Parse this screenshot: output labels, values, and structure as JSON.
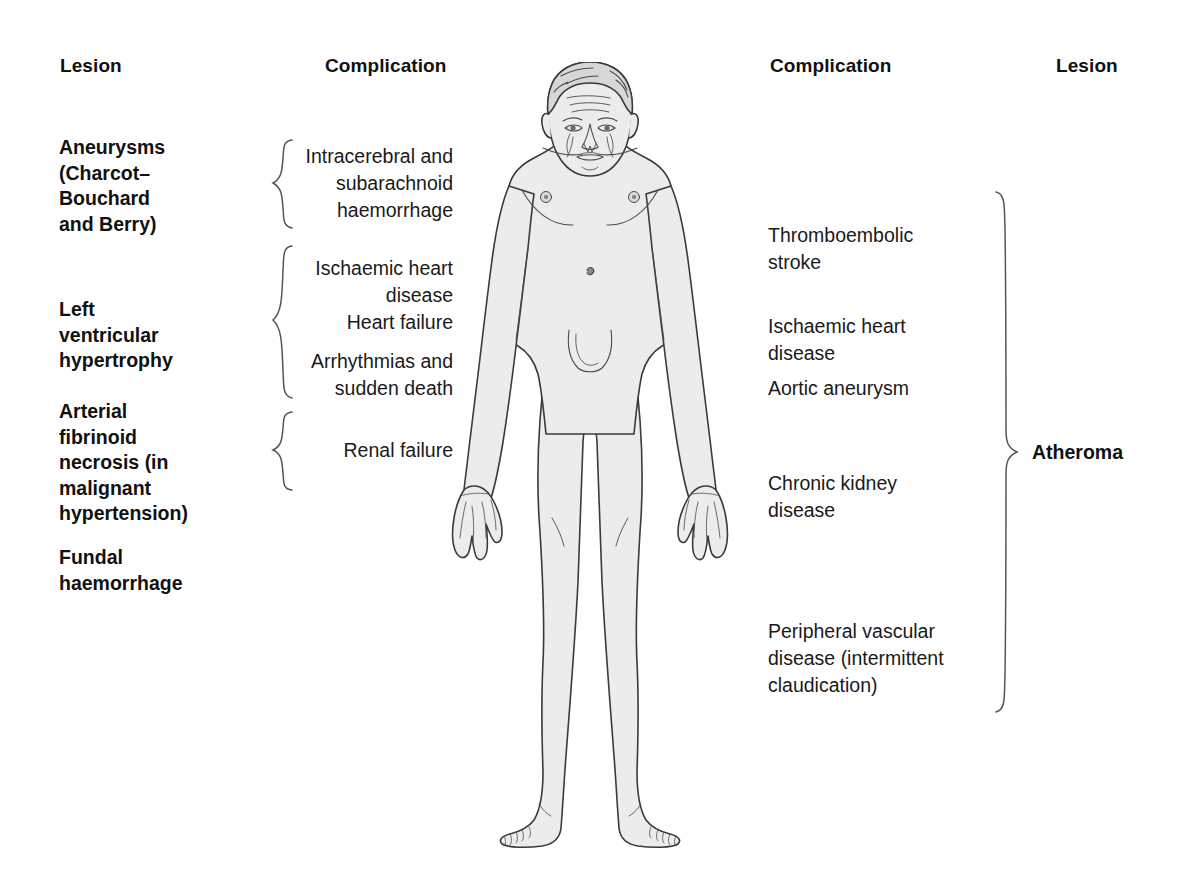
{
  "diagram": {
    "figure_name": "anterior-male-body-figure",
    "colors": {
      "text": "#111111",
      "body_fill": "#eceded",
      "body_outline": "#333333",
      "brace": "#555555",
      "background": "#ffffff"
    }
  },
  "headers": {
    "left_lesion": "Lesion",
    "left_complication": "Complication",
    "right_complication": "Complication",
    "right_lesion": "Lesion"
  },
  "left_lesions": [
    {
      "id": "aneurysms",
      "text": "Aneurysms\n(Charcot–\nBouchard\nand Berry)"
    },
    {
      "id": "left-ventricular-hypertrophy",
      "text": "Left\nventricular\nhypertrophy"
    },
    {
      "id": "arterial-fibrinoid-necrosis",
      "text": "Arterial\nfibrinoid\nnecrosis (in\nmalignant\nhypertension)"
    },
    {
      "id": "fundal-haemorrhage",
      "text": "Fundal\nhaemorrhage"
    }
  ],
  "left_complications": [
    {
      "id": "intracerebral-subarachnoid-haemorrhage",
      "text": "Intracerebral and\nsubarachnoid\nhaemorrhage"
    },
    {
      "id": "ischaemic-heart-disease-left",
      "text": "Ischaemic heart\ndisease"
    },
    {
      "id": "heart-failure",
      "text": "Heart failure"
    },
    {
      "id": "arrhythmias-sudden-death",
      "text": "Arrhythmias and\nsudden death"
    },
    {
      "id": "renal-failure",
      "text": "Renal failure"
    }
  ],
  "right_complications": [
    {
      "id": "thromboembolic-stroke",
      "text": "Thromboembolic\nstroke"
    },
    {
      "id": "ischaemic-heart-disease-right",
      "text": "Ischaemic heart\ndisease"
    },
    {
      "id": "aortic-aneurysm",
      "text": "Aortic aneurysm"
    },
    {
      "id": "chronic-kidney-disease",
      "text": "Chronic kidney\ndisease"
    },
    {
      "id": "peripheral-vascular-disease",
      "text": "Peripheral vascular\ndisease (intermittent\nclaudication)"
    }
  ],
  "right_lesions": [
    {
      "id": "atheroma",
      "text": "Atheroma"
    }
  ],
  "braces": {
    "left": [
      {
        "id": "brace-aneurysms",
        "top": 138,
        "height": 92
      },
      {
        "id": "brace-lvh",
        "top": 244,
        "height": 156
      },
      {
        "id": "brace-renal",
        "top": 410,
        "height": 82
      }
    ],
    "right": [
      {
        "id": "brace-atheroma",
        "top": 190,
        "height": 524
      }
    ]
  }
}
